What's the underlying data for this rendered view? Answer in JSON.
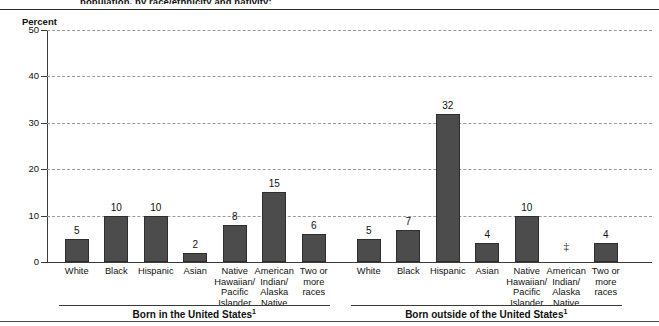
{
  "top_caption": "population, by race/ethnicity and nativity:",
  "axis": {
    "ylabel": "Percent",
    "yticks": [
      0,
      10,
      20,
      30,
      40,
      50
    ]
  },
  "groups": [
    {
      "label": "Born in the United States",
      "label_superscript": "1",
      "bars": [
        {
          "category": "White",
          "value": 5,
          "value_label": "5"
        },
        {
          "category": "Black",
          "value": 10,
          "value_label": "10"
        },
        {
          "category": "Hispanic",
          "value": 10,
          "value_label": "10"
        },
        {
          "category": "Asian",
          "value": 2,
          "value_label": "2"
        },
        {
          "category": "Native Hawaiian/ Pacific Islander",
          "value": 8,
          "value_label": "8"
        },
        {
          "category": "American Indian/ Alaska Native",
          "value": 15,
          "value_label": "15"
        },
        {
          "category": "Two or more races",
          "value": 6,
          "value_label": "6"
        }
      ]
    },
    {
      "label": "Born outside of the United States",
      "label_superscript": "1",
      "bars": [
        {
          "category": "White",
          "value": 5,
          "value_label": "5"
        },
        {
          "category": "Black",
          "value": 7,
          "value_label": "7"
        },
        {
          "category": "Hispanic",
          "value": 32,
          "value_label": "32"
        },
        {
          "category": "Asian",
          "value": 4,
          "value_label": "4"
        },
        {
          "category": "Native Hawaiian/ Pacific Islander",
          "value": 10,
          "value_label": "10"
        },
        {
          "category": "American Indian/ Alaska Native",
          "value": null,
          "value_label": "‡"
        },
        {
          "category": "Two or more races",
          "value": 4,
          "value_label": "4"
        }
      ]
    }
  ],
  "chart_data": {
    "type": "bar",
    "title": "population, by race/ethnicity and nativity:",
    "xlabel": "",
    "ylabel": "Percent",
    "ylim": [
      0,
      50
    ],
    "yticks": [
      0,
      10,
      20,
      30,
      40,
      50
    ],
    "grid": true,
    "legend": "none",
    "group_labels": [
      "Born in the United States¹",
      "Born outside of the United States¹"
    ],
    "categories": [
      "White",
      "Black",
      "Hispanic",
      "Asian",
      "Native Hawaiian/ Pacific Islander",
      "American Indian/ Alaska Native",
      "Two or more races"
    ],
    "series": [
      {
        "name": "Born in the United States",
        "values": [
          5,
          10,
          10,
          2,
          8,
          15,
          6
        ]
      },
      {
        "name": "Born outside of the United States",
        "values": [
          5,
          7,
          32,
          4,
          10,
          null,
          4
        ]
      }
    ],
    "annotations": [
      {
        "text": "‡",
        "group": "Born outside of the United States",
        "category": "American Indian/ Alaska Native",
        "meaning": "value suppressed / not reportable"
      }
    ],
    "bar_color": "#4c4c4c"
  },
  "colors": {
    "bar": "#4c4c4c",
    "axis": "#3a3a3a",
    "grid": "#9a9a9a",
    "text": "#111111"
  }
}
